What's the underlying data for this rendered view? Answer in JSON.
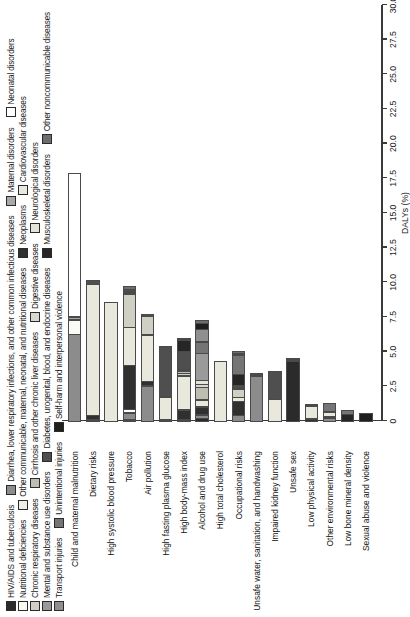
{
  "chart_data": {
    "type": "bar",
    "title": "",
    "subtitle": "",
    "orientation": "horizontal-stacked",
    "xlabel": "DALYs (%)",
    "ylabel": "",
    "xlim": [
      0,
      30
    ],
    "xticks": [
      "0",
      "2.5",
      "5.0",
      "7.5",
      "10.0",
      "12.5",
      "15.0",
      "17.5",
      "20.0",
      "22.5",
      "25.0",
      "27.5",
      "30.0"
    ],
    "grid": false,
    "legend_position": "top",
    "categories": [
      "Child and maternal malnutrition",
      "Dietary risks",
      "High systolic blood pressure",
      "Tobacco",
      "Air pollution",
      "High fasting plasma glucose",
      "High body-mass index",
      "Alcohol and drug use",
      "High total cholesterol",
      "Occupational risks",
      "Unsafe water, sanitation, and handwashing",
      "Impaired kidney function",
      "Unsafe sex",
      "Low physical activity",
      "Other environmental risks",
      "Low bone mineral density",
      "Sexual abuse and violence"
    ],
    "series": [
      {
        "name": "HIV/AIDS and tuberculosis",
        "color": "#2b2b2b",
        "values": [
          0.0,
          0.0,
          0.0,
          0.1,
          0.0,
          0.0,
          0.0,
          0.25,
          0.0,
          0.0,
          0.0,
          0.0,
          4.4,
          0.0,
          0.0,
          0.0,
          0.0
        ]
      },
      {
        "name": "Diarrhea, lower respiratory infections, and other common infectious diseases",
        "color": "#8c8c8c",
        "values": [
          6.3,
          0.0,
          0.0,
          0.55,
          2.6,
          0.0,
          0.0,
          0.3,
          0.0,
          0.45,
          3.3,
          0.0,
          0.15,
          0.0,
          0.25,
          0.0,
          0.0
        ]
      },
      {
        "name": "Nutritional deficiencies",
        "color": "#fbfbf5",
        "values": [
          1.1,
          0.15,
          0.0,
          0.0,
          0.0,
          0.0,
          0.0,
          0.0,
          0.0,
          0.0,
          0.0,
          0.0,
          0.0,
          0.0,
          0.0,
          0.0,
          0.0
        ]
      },
      {
        "name": "Other communicable, maternal, neonatal, and nutritional diseases",
        "color": "#efeee4",
        "values": [
          0.0,
          0.0,
          0.0,
          0.0,
          0.0,
          0.0,
          0.0,
          0.0,
          0.0,
          0.0,
          0.15,
          0.0,
          0.0,
          0.0,
          0.0,
          0.0,
          0.0
        ]
      },
      {
        "name": "Maternal disorders",
        "color": "#a8a8a8",
        "values": [
          0.25,
          0.0,
          0.0,
          0.0,
          0.0,
          0.0,
          0.15,
          0.0,
          0.0,
          0.0,
          0.0,
          0.0,
          0.0,
          0.0,
          0.0,
          0.0,
          0.0
        ]
      },
      {
        "name": "Neonatal disorders",
        "color": "#ffffff",
        "values": [
          10.4,
          0.0,
          0.0,
          0.3,
          0.0,
          0.0,
          0.0,
          0.0,
          0.0,
          0.0,
          0.0,
          0.0,
          0.0,
          0.0,
          0.0,
          0.0,
          0.0
        ]
      },
      {
        "name": "Neoplasms",
        "color": "#303030",
        "values": [
          0.0,
          0.35,
          0.0,
          3.2,
          0.35,
          0.1,
          0.75,
          0.6,
          0.0,
          1.05,
          0.0,
          0.0,
          0.15,
          0.2,
          0.1,
          0.0,
          0.0
        ]
      },
      {
        "name": "Cardiovascular diseases",
        "color": "#e8e8dd",
        "values": [
          0.0,
          9.5,
          8.6,
          2.8,
          3.4,
          1.7,
          2.5,
          0.55,
          4.4,
          0.35,
          0.0,
          1.6,
          0.0,
          1.0,
          0.35,
          0.0,
          0.0
        ]
      },
      {
        "name": "Chronic respiratory diseases",
        "color": "#cfcfc4",
        "values": [
          0.0,
          0.0,
          0.0,
          2.4,
          1.4,
          0.0,
          0.2,
          0.0,
          0.0,
          0.65,
          0.0,
          0.0,
          0.0,
          0.0,
          0.15,
          0.0,
          0.0
        ]
      },
      {
        "name": "Cirrhosis and other chronic liver diseases",
        "color": "#bdbdb2",
        "values": [
          0.0,
          0.0,
          0.0,
          0.15,
          0.0,
          0.0,
          0.2,
          0.95,
          0.0,
          0.0,
          0.0,
          0.0,
          0.0,
          0.0,
          0.0,
          0.0,
          0.0
        ]
      },
      {
        "name": "Digestive diseases",
        "color": "#d8d8ce",
        "values": [
          0.0,
          0.0,
          0.0,
          0.1,
          0.0,
          0.0,
          0.1,
          0.25,
          0.0,
          0.1,
          0.0,
          0.0,
          0.0,
          0.0,
          0.0,
          0.0,
          0.0
        ]
      },
      {
        "name": "Neurological disorders",
        "color": "#e4e4d9",
        "values": [
          0.0,
          0.0,
          0.0,
          0.0,
          0.0,
          0.0,
          0.0,
          0.35,
          0.0,
          0.0,
          0.0,
          0.0,
          0.0,
          0.0,
          0.0,
          0.0,
          0.0
        ]
      },
      {
        "name": "Mental and substance use disorders",
        "color": "#9a9a9a",
        "values": [
          0.0,
          0.0,
          0.0,
          0.0,
          0.0,
          0.0,
          0.0,
          2.0,
          0.0,
          0.0,
          0.0,
          0.0,
          0.0,
          0.0,
          0.0,
          0.0,
          0.0
        ]
      },
      {
        "name": "Diabetes, urogenital, blood, and endocrine diseases",
        "color": "#4f4f4f",
        "values": [
          0.0,
          0.35,
          0.0,
          0.2,
          0.15,
          3.7,
          1.4,
          0.0,
          0.0,
          0.2,
          0.0,
          2.1,
          0.0,
          0.15,
          0.0,
          0.0,
          0.0
        ]
      },
      {
        "name": "Musculoskeletal disorders",
        "color": "#262626",
        "values": [
          0.0,
          0.0,
          0.0,
          0.0,
          0.0,
          0.0,
          0.85,
          0.0,
          0.0,
          0.85,
          0.0,
          0.0,
          0.0,
          0.0,
          0.0,
          0.55,
          0.0
        ]
      },
      {
        "name": "Unintentional injuries",
        "color": "#757575",
        "values": [
          0.0,
          0.0,
          0.0,
          0.0,
          0.0,
          0.0,
          0.0,
          0.85,
          0.0,
          1.4,
          0.0,
          0.0,
          0.0,
          0.0,
          0.6,
          0.35,
          0.0
        ]
      },
      {
        "name": "Transport injuries",
        "color": "#8f8f8f",
        "values": [
          0.0,
          0.0,
          0.0,
          0.0,
          0.0,
          0.0,
          0.0,
          0.95,
          0.0,
          0.15,
          0.0,
          0.0,
          0.0,
          0.0,
          0.0,
          0.0,
          0.0
        ]
      },
      {
        "name": "Self-harm and interpersonal violence",
        "color": "#1f1f1f",
        "values": [
          0.0,
          0.0,
          0.0,
          0.0,
          0.0,
          0.0,
          0.0,
          0.5,
          0.0,
          0.0,
          0.0,
          0.0,
          0.0,
          0.0,
          0.0,
          0.0,
          0.6
        ]
      },
      {
        "name": "Other noncommunicable diseases",
        "color": "#6e6e6e",
        "values": [
          0.0,
          0.0,
          0.0,
          0.25,
          0.0,
          0.0,
          0.15,
          0.25,
          0.0,
          0.25,
          0.1,
          0.0,
          0.0,
          0.0,
          0.0,
          0.0,
          0.0
        ]
      }
    ],
    "totals": [
      18.05,
      10.35,
      8.6,
      10.05,
      7.9,
      5.5,
      6.3,
      7.8,
      4.4,
      5.45,
      3.55,
      3.7,
      4.7,
      1.35,
      1.45,
      0.9,
      0.6
    ]
  },
  "legend": {
    "rows": [
      [
        {
          "label": "HIV/AIDS and tuberculosis",
          "color": "#2b2b2b"
        },
        {
          "label": "Diarrhea, lower respiratory infections, and other common infectious diseases",
          "color": "#8c8c8c"
        },
        {
          "label": "Maternal disorders",
          "color": "#a8a8a8"
        },
        {
          "label": "Neonatal disorders",
          "color": "#ffffff"
        }
      ],
      [
        {
          "label": "Nutritional deficiencies",
          "color": "#fbfbf5"
        },
        {
          "label": "Other communicable, maternal, neonatal, and nutritional diseases",
          "color": "#efeee4"
        },
        {
          "label": "Neoplasms",
          "color": "#303030"
        },
        {
          "label": "Cardiovascular diseases",
          "color": "#e8e8dd"
        }
      ],
      [
        {
          "label": "Chronic respiratory diseases",
          "color": "#cfcfc4"
        },
        {
          "label": "Cirrhosis and other chronic liver diseases",
          "color": "#bdbdb2"
        },
        {
          "label": "Digestive diseases",
          "color": "#d8d8ce"
        },
        {
          "label": "Neurological disorders",
          "color": "#e4e4d9"
        }
      ],
      [
        {
          "label": "Mental and substance use disorders",
          "color": "#9a9a9a"
        },
        {
          "label": "Diabetes, urogenital, blood, and endocrine diseases",
          "color": "#4f4f4f"
        },
        {
          "label": "Musculoskeletal disorders",
          "color": "#262626"
        },
        {
          "label": "Other noncommunicable diseases",
          "color": "#6e6e6e"
        }
      ],
      [
        {
          "label": "Transport injuries",
          "color": "#8f8f8f"
        },
        {
          "label": "Unintentional injuries",
          "color": "#757575"
        },
        {
          "label": "Self-harm and interpersonal violence",
          "color": "#1f1f1f"
        }
      ]
    ]
  }
}
